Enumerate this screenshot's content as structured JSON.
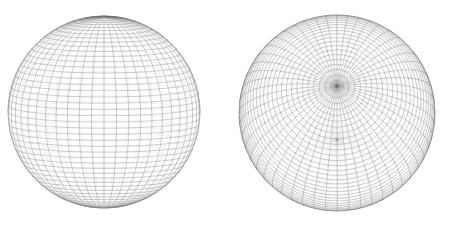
{
  "figure": {
    "background_color": "#ffffff",
    "width": 453,
    "height": 228,
    "line_color": "#6e6e6e",
    "line_color_light": "#9a9a9a",
    "line_width": 0.35
  },
  "chart_data": {
    "type": "line",
    "subtitle": "",
    "xlabel": "",
    "ylabel": "",
    "grid": false,
    "legend": "none",
    "annotations": [],
    "panels": [
      {
        "name": "left-sphere",
        "label": "Axis-aligned UV sphere mesh",
        "center_x": 104,
        "center_y": 112,
        "radius": 96,
        "latitude_divisions": 48,
        "longitude_divisions": 48,
        "pole_axis_tilt_deg": 6,
        "pole_axis_yaw_deg": 0,
        "pole_facing": "vertical",
        "stroke": "#6e6e6e",
        "stroke_width": 0.35
      },
      {
        "name": "right-sphere",
        "label": "Pole-toward-viewer rotated UV sphere mesh",
        "center_x": 337,
        "center_y": 113,
        "radius": 98,
        "latitude_divisions": 52,
        "longitude_divisions": 52,
        "pole_axis_tilt_deg": 74,
        "pole_axis_yaw_deg": 14,
        "pole_facing": "viewer",
        "pole_screen_x": 332,
        "pole_screen_y": 128,
        "stroke": "#6e6e6e",
        "stroke_width": 0.35
      }
    ]
  }
}
